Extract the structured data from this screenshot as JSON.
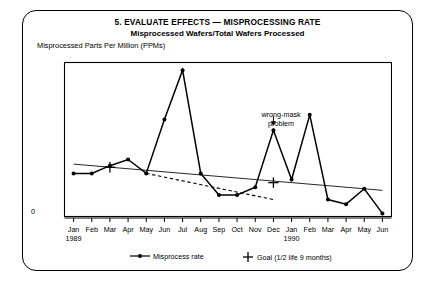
{
  "card": {
    "title_line1": "5.  EVALUATE EFFECTS — MISPROCESSING RATE",
    "title_line2": "Misprocessed Wafers/Total Wafers Processed"
  },
  "chart_data": {
    "type": "line",
    "title": "5.  EVALUATE EFFECTS — MISPROCESSING RATE",
    "subtitle": "Misprocessed Wafers/Total Wafers Processed",
    "ylabel": "Misprocessed Parts Per Million (PPMs)",
    "xlabel": "",
    "grid": false,
    "legend_position": "bottom",
    "ylim": [
      0,
      100
    ],
    "ytick_labels": [
      "0"
    ],
    "ytick_values": [
      0
    ],
    "categories": [
      "Jan",
      "Feb",
      "Mar",
      "Apr",
      "May",
      "Jun",
      "Jul",
      "Aug",
      "Sep",
      "Oct",
      "Nov",
      "Dec",
      "Jan",
      "Feb",
      "Mar",
      "Apr",
      "May",
      "Jun"
    ],
    "year_labels": [
      {
        "index": 0,
        "text": "1989"
      },
      {
        "index": 12,
        "text": "1990"
      }
    ],
    "series": [
      {
        "name": "Misprocess rate",
        "marker": "dot",
        "style": "solid",
        "values": [
          28,
          28,
          33,
          37,
          28,
          63,
          95,
          28,
          14,
          14,
          19,
          56,
          24,
          66,
          11,
          8,
          18,
          2
        ]
      },
      {
        "name": "Goal (1/2 life 9 months)",
        "marker": "plus",
        "style": "trend-solid",
        "points": [
          {
            "index": 2,
            "value": 32
          },
          {
            "index": 11,
            "value": 22
          }
        ],
        "trend_from": {
          "index": 0,
          "value": 34
        },
        "trend_to": {
          "index": 17,
          "value": 17
        }
      },
      {
        "name": "Half-life projection",
        "marker": "none",
        "style": "dashed",
        "points": [
          {
            "index": 4,
            "value": 28
          },
          {
            "index": 11,
            "value": 11
          }
        ]
      }
    ],
    "annotations": [
      {
        "text": "wrong-mask\nproblem",
        "line1": "wrong-mask",
        "line2": "problem",
        "target_index": 11
      }
    ]
  },
  "legend": {
    "items": [
      {
        "label": "Misprocess rate",
        "marker": "line-dot"
      },
      {
        "label": "Goal (1/2 life 9 months)",
        "marker": "plus"
      }
    ]
  },
  "annotation": {
    "line1": "wrong-mask",
    "line2": "problem"
  }
}
